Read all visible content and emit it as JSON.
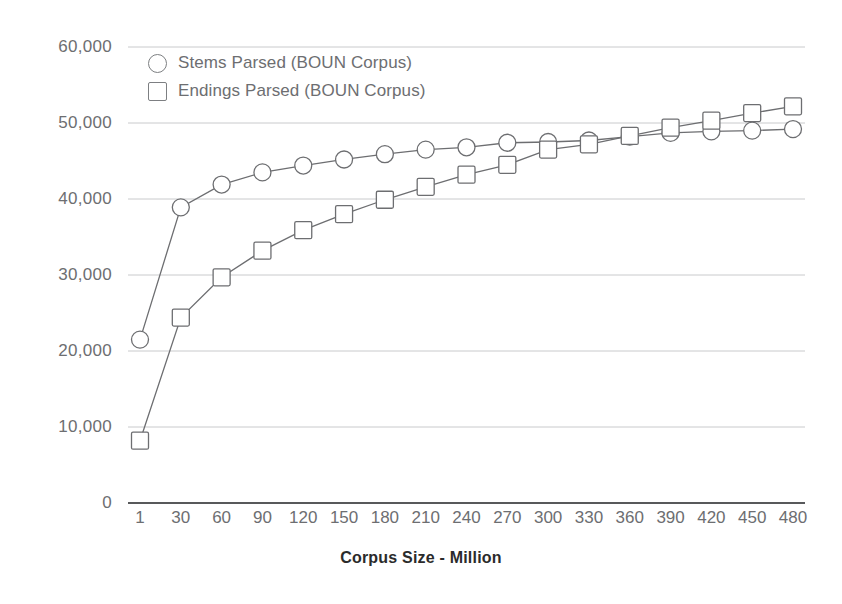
{
  "chart_data": {
    "type": "line",
    "title": "",
    "xlabel": "Corpus Size - Million",
    "ylabel": "",
    "categories": [
      "1",
      "30",
      "60",
      "90",
      "120",
      "150",
      "180",
      "210",
      "240",
      "270",
      "300",
      "330",
      "360",
      "390",
      "420",
      "450",
      "480"
    ],
    "ylim": [
      0,
      60000
    ],
    "ytick_labels": [
      "0",
      "10,000",
      "20,000",
      "30,000",
      "40,000",
      "50,000",
      "60,000"
    ],
    "ytick_values": [
      0,
      10000,
      20000,
      30000,
      40000,
      50000,
      60000
    ],
    "grid": true,
    "grid_axis": "y",
    "legend_position": "top-left",
    "series": [
      {
        "name": "Stems Parsed (BOUN Corpus)",
        "marker": "circle",
        "color": "#6d6e71",
        "values": [
          21500,
          38900,
          41900,
          43500,
          44400,
          45200,
          45900,
          46500,
          46800,
          47400,
          47500,
          47700,
          48200,
          48700,
          48900,
          49000,
          49200
        ]
      },
      {
        "name": "Endings Parsed (BOUN Corpus)",
        "marker": "square",
        "color": "#6d6e71",
        "values": [
          8200,
          24400,
          29700,
          33200,
          35900,
          38000,
          39900,
          41600,
          43200,
          44500,
          46500,
          47200,
          48300,
          49400,
          50300,
          51300,
          52200
        ]
      }
    ]
  },
  "axis": {
    "x_title": "Corpus Size - Million"
  },
  "legend": {
    "items": [
      {
        "label": "Stems Parsed (BOUN Corpus)",
        "marker": "circle"
      },
      {
        "label": "Endings Parsed (BOUN Corpus)",
        "marker": "square"
      }
    ]
  },
  "style": {
    "axis_color": "#58595b",
    "grid_color": "#c9cacc",
    "series_color": "#7d7f82",
    "text_color": "#6d6e71",
    "background": "#ffffff"
  }
}
